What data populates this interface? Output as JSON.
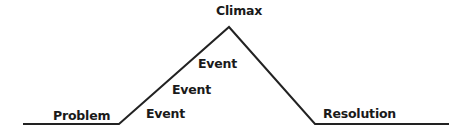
{
  "diagram": {
    "type": "plot-mountain",
    "labels": {
      "climax": "Climax",
      "event_1": "Event",
      "event_2": "Event",
      "event_3": "Event",
      "problem": "Problem",
      "resolution": "Resolution"
    },
    "line_color": "#222222"
  }
}
